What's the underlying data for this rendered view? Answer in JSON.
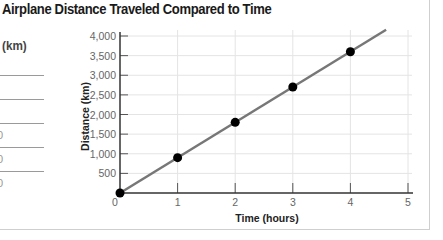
{
  "chart_data": {
    "type": "line",
    "title": "Airplane Distance Traveled Compared to Time",
    "xlabel": "Time (hours)",
    "ylabel": "Distance (km)",
    "x": [
      0,
      1,
      2,
      3,
      4
    ],
    "values": [
      0,
      900,
      1800,
      2700,
      3600
    ],
    "series": [
      {
        "name": "Airplane distance",
        "x": [
          0,
          1,
          2,
          3,
          4
        ],
        "values": [
          0,
          900,
          1800,
          2700,
          3600
        ]
      }
    ],
    "xlim": [
      0,
      5
    ],
    "ylim": [
      0,
      4000
    ],
    "x_ticks": [
      "0",
      "1",
      "2",
      "3",
      "4",
      "5"
    ],
    "y_ticks": [
      "500",
      "1,000",
      "1,500",
      "2,000",
      "2,500",
      "3,000",
      "3,500",
      "4,000"
    ],
    "grid": true,
    "legend": "none",
    "line_color": "#777777",
    "marker_color": "#000000"
  },
  "left_panel": {
    "header": "(km)",
    "partial_digits": [
      "0",
      "0",
      "0"
    ]
  }
}
